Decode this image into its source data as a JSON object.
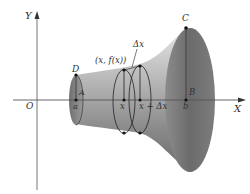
{
  "diagram": {
    "axes": {
      "x_label": "X",
      "y_label": "Y",
      "origin_label": "O"
    },
    "points": {
      "D": "D",
      "A": "A",
      "a": "a",
      "C": "C",
      "B": "B",
      "b": "b",
      "x": "x",
      "x_plus_dx": "x + Δx",
      "curve_point": "(x, f(x))",
      "delta_x": "Δx"
    },
    "colors": {
      "axis": "#555555",
      "solid_dark": "#6e6e6e",
      "solid_light": "#d8d8d8",
      "disk_outline": "#2a2a2a",
      "background": "#ffffff"
    }
  }
}
